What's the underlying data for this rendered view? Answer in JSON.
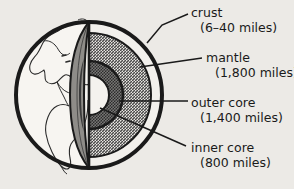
{
  "diagram": {
    "type": "cutaway-cross-section",
    "background_color": "#eceae6",
    "ink_color": "#1a1a1a",
    "globe": {
      "center_x": 89,
      "center_y": 95,
      "radius": 75,
      "outline_width": 4,
      "visible_hemisphere": "Americas"
    },
    "layers": [
      {
        "key": "crust",
        "name": "crust",
        "thickness": "(6–40 miles)",
        "fill": "#ffffff",
        "radius": 75,
        "order": 1
      },
      {
        "key": "mantle",
        "name": "mantle",
        "thickness": "(1,800 miles)",
        "fill": "hatch-medium",
        "radius": 62,
        "order": 2
      },
      {
        "key": "outer_core",
        "name": "outer core",
        "thickness": "(1,400 miles)",
        "fill": "hatch-dense",
        "radius": 34,
        "order": 3
      },
      {
        "key": "inner_core",
        "name": "inner core",
        "thickness": "(800 miles)",
        "fill": "#f2f0ec",
        "radius": 20,
        "order": 4
      }
    ],
    "cut_face": {
      "description": "dark crescent showing sliced crust edge",
      "fill": "#8c8c8c"
    }
  },
  "labels": {
    "crust": {
      "name": "crust",
      "detail": "(6–40 miles)"
    },
    "mantle": {
      "name": "mantle",
      "detail": "(1,800 miles)"
    },
    "outer_core": {
      "name": "outer core",
      "detail": "(1,400 miles)"
    },
    "inner_core": {
      "name": "inner core",
      "detail": "(800 miles)"
    }
  }
}
